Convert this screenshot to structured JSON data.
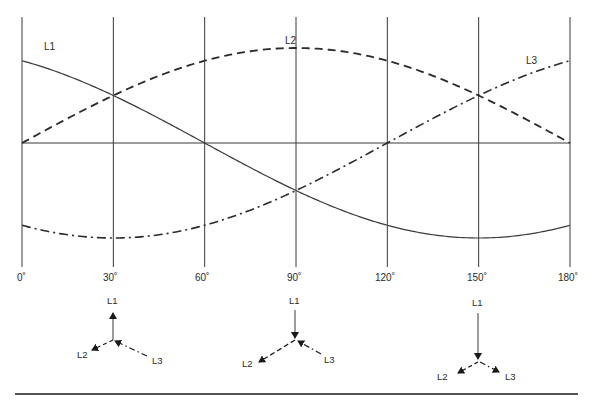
{
  "chart_data": {
    "type": "line",
    "title": "",
    "xlabel": "",
    "ylabel": "",
    "x_ticks": [
      "0˚",
      "30˚",
      "60˚",
      "90˚",
      "120˚",
      "150˚",
      "180˚"
    ],
    "x_values_deg": [
      0,
      30,
      60,
      90,
      120,
      150,
      180
    ],
    "xlim": [
      0,
      180
    ],
    "ylim": [
      -1,
      1
    ],
    "grid": "vertical lines at every 30˚ plus zero axis",
    "series": [
      {
        "name": "L1",
        "style": "solid",
        "formula": "sin(θ + 120˚)",
        "values": [
          0.866,
          0.5,
          0.0,
          -0.5,
          -0.866,
          -1.0,
          -0.866
        ]
      },
      {
        "name": "L2",
        "style": "dashed",
        "formula": "sin(θ)",
        "values": [
          0.0,
          0.5,
          0.866,
          1.0,
          0.866,
          0.5,
          0.0
        ]
      },
      {
        "name": "L3",
        "style": "dash-dot",
        "formula": "sin(θ − 120˚)",
        "values": [
          -0.866,
          -1.0,
          -0.866,
          -0.5,
          0.0,
          0.5,
          0.866
        ]
      }
    ],
    "curve_labels": [
      {
        "text": "L1",
        "x": 44,
        "y": 50
      },
      {
        "text": "L2",
        "x": 288,
        "y": 44
      },
      {
        "text": "L3",
        "x": 530,
        "y": 63
      }
    ]
  },
  "phasor_diagrams": [
    {
      "at_angle": "30˚",
      "labels": {
        "L1": "L1",
        "L2": "L2",
        "L3": "L3"
      }
    },
    {
      "at_angle": "90˚",
      "labels": {
        "L1": "L1",
        "L2": "L2",
        "L3": "L3"
      }
    },
    {
      "at_angle": "150˚",
      "labels": {
        "L1": "L1",
        "L2": "L2",
        "L3": "L3"
      }
    }
  ]
}
